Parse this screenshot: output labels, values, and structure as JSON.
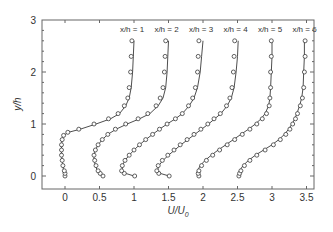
{
  "chart_data": {
    "type": "line",
    "title": "",
    "xlabel": "U/U0",
    "xlabel_main": "U/U",
    "xlabel_sub": "0",
    "ylabel": "y/h",
    "xlim": [
      -0.35,
      3.6
    ],
    "ylim": [
      -0.2,
      3
    ],
    "xticks": [
      0,
      0.5,
      1,
      1.5,
      2,
      2.5,
      3,
      3.5
    ],
    "xtick_labels": [
      "0",
      "0.5",
      "1",
      "1.5",
      "2",
      "2.5",
      "3",
      "3.5"
    ],
    "yticks": [
      0,
      1,
      2,
      3
    ],
    "ytick_labels": [
      "0",
      "1",
      "2",
      "3"
    ],
    "grid": false,
    "legend": "none",
    "series": [
      {
        "name": "x/h = 1",
        "offset": 0,
        "y": [
          0,
          0.05,
          0.1,
          0.2,
          0.3,
          0.4,
          0.5,
          0.6,
          0.7,
          0.78,
          0.84,
          0.9,
          1.0,
          1.1,
          1.2,
          1.35,
          1.5,
          1.7,
          2.0,
          2.3,
          2.6
        ],
        "line": [
          0.0,
          -0.01,
          -0.02,
          -0.03,
          -0.04,
          -0.05,
          -0.05,
          -0.05,
          -0.04,
          -0.02,
          0.05,
          0.22,
          0.45,
          0.66,
          0.79,
          0.88,
          0.93,
          0.96,
          0.98,
          0.99,
          1.0
        ],
        "markers": [
          0.0,
          0.0,
          -0.01,
          -0.03,
          -0.04,
          -0.05,
          -0.05,
          -0.05,
          -0.04,
          -0.02,
          0.04,
          0.2,
          0.42,
          0.63,
          0.77,
          0.86,
          0.91,
          0.93,
          0.95,
          0.96,
          0.97
        ]
      },
      {
        "name": "x/h = 2",
        "offset": 0.5,
        "y": [
          0,
          0.05,
          0.1,
          0.2,
          0.3,
          0.4,
          0.5,
          0.6,
          0.7,
          0.8,
          0.9,
          1.0,
          1.1,
          1.2,
          1.35,
          1.5,
          1.7,
          2.0,
          2.3,
          2.6
        ],
        "line": [
          0.53,
          0.5,
          0.47,
          0.44,
          0.42,
          0.42,
          0.44,
          0.48,
          0.54,
          0.62,
          0.74,
          0.9,
          1.08,
          1.23,
          1.35,
          1.42,
          1.46,
          1.48,
          1.49,
          1.5
        ],
        "markers": [
          0.55,
          0.51,
          0.48,
          0.45,
          0.43,
          0.42,
          0.44,
          0.48,
          0.54,
          0.62,
          0.73,
          0.88,
          1.06,
          1.2,
          1.32,
          1.38,
          1.42,
          1.44,
          1.45,
          1.46
        ]
      },
      {
        "name": "x/h = 3",
        "offset": 1.0,
        "y": [
          0,
          0.05,
          0.1,
          0.2,
          0.3,
          0.4,
          0.5,
          0.6,
          0.7,
          0.8,
          0.9,
          1.0,
          1.1,
          1.2,
          1.35,
          1.5,
          1.7,
          2.0,
          2.3,
          2.6
        ],
        "line": [
          1.0,
          0.88,
          0.83,
          0.83,
          0.87,
          0.93,
          1.0,
          1.08,
          1.17,
          1.27,
          1.37,
          1.48,
          1.6,
          1.7,
          1.8,
          1.87,
          1.92,
          1.96,
          1.98,
          2.0
        ],
        "markers": [
          1.01,
          0.86,
          0.82,
          0.83,
          0.87,
          0.93,
          1.0,
          1.08,
          1.17,
          1.27,
          1.37,
          1.48,
          1.6,
          1.7,
          1.79,
          1.85,
          1.89,
          1.92,
          1.93,
          1.94
        ]
      },
      {
        "name": "x/h = 4",
        "offset": 1.5,
        "y": [
          0,
          0.05,
          0.1,
          0.2,
          0.3,
          0.4,
          0.5,
          0.6,
          0.7,
          0.8,
          0.9,
          1.0,
          1.1,
          1.2,
          1.35,
          1.5,
          1.7,
          2.0,
          2.3,
          2.6
        ],
        "line": [
          1.51,
          1.38,
          1.34,
          1.36,
          1.42,
          1.5,
          1.59,
          1.68,
          1.78,
          1.88,
          1.98,
          2.08,
          2.17,
          2.26,
          2.35,
          2.41,
          2.45,
          2.48,
          2.5,
          2.51
        ],
        "markers": [
          1.51,
          1.36,
          1.33,
          1.35,
          1.41,
          1.49,
          1.58,
          1.67,
          1.77,
          1.87,
          1.97,
          2.07,
          2.16,
          2.25,
          2.34,
          2.39,
          2.42,
          2.44,
          2.45,
          2.46
        ]
      },
      {
        "name": "x/h = 5",
        "offset": 2.0,
        "y": [
          0,
          0.05,
          0.1,
          0.2,
          0.3,
          0.4,
          0.5,
          0.6,
          0.7,
          0.8,
          0.9,
          1.0,
          1.1,
          1.2,
          1.35,
          1.5,
          1.7,
          2.0,
          2.3,
          2.6
        ],
        "line": [
          1.95,
          1.92,
          1.92,
          1.96,
          2.03,
          2.12,
          2.22,
          2.33,
          2.44,
          2.55,
          2.66,
          2.76,
          2.84,
          2.9,
          2.95,
          2.97,
          2.98,
          2.99,
          3.0,
          3.0
        ],
        "markers": [
          1.94,
          1.93,
          1.94,
          1.98,
          2.05,
          2.14,
          2.24,
          2.35,
          2.46,
          2.57,
          2.68,
          2.78,
          2.86,
          2.92,
          2.96,
          2.97,
          2.98,
          2.98,
          2.99,
          2.99
        ]
      },
      {
        "name": "x/h = 6",
        "offset": 2.5,
        "y": [
          0,
          0.05,
          0.1,
          0.2,
          0.3,
          0.4,
          0.5,
          0.6,
          0.7,
          0.8,
          0.9,
          1.0,
          1.1,
          1.2,
          1.35,
          1.5,
          1.7,
          2.0,
          2.3,
          2.6
        ],
        "line": [
          2.52,
          2.52,
          2.53,
          2.58,
          2.66,
          2.76,
          2.88,
          3.0,
          3.1,
          3.18,
          3.24,
          3.29,
          3.33,
          3.36,
          3.4,
          3.43,
          3.45,
          3.46,
          3.47,
          3.47
        ],
        "markers": [
          2.52,
          2.53,
          2.55,
          2.6,
          2.68,
          2.78,
          2.9,
          3.02,
          3.12,
          3.2,
          3.26,
          3.3,
          3.34,
          3.37,
          3.41,
          3.44,
          3.46,
          3.47,
          3.48,
          3.48
        ]
      }
    ]
  },
  "colors": {
    "line": "#3a3a3a",
    "marker_stroke": "#3a3a3a",
    "marker_fill": "#ffffff",
    "axis": "#555555",
    "text": "#333333"
  }
}
